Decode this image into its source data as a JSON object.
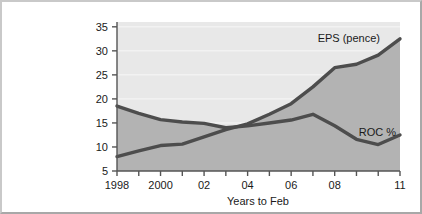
{
  "chart_data": {
    "type": "area",
    "title": "",
    "subtitle": "",
    "xlabel": "Years to Feb",
    "ylabel": "",
    "xlim": [
      1998,
      2011
    ],
    "ylim": [
      5,
      36
    ],
    "grid": true,
    "legend_position": "inline-right",
    "x": [
      1998,
      1999,
      2000,
      2001,
      2002,
      2003,
      2004,
      2005,
      2006,
      2007,
      2008,
      2009,
      2010,
      2011
    ],
    "x_tick_values": [
      1998,
      1999,
      2000,
      2001,
      2002,
      2003,
      2004,
      2005,
      2006,
      2007,
      2008,
      2009,
      2010,
      2011
    ],
    "x_tick_labels": [
      "1998",
      "",
      "2000",
      "",
      "02",
      "",
      "04",
      "",
      "06",
      "",
      "08",
      "",
      "",
      "11"
    ],
    "y_tick_values": [
      5,
      10,
      15,
      20,
      25,
      30,
      35
    ],
    "y_tick_labels": [
      "5",
      "10",
      "15",
      "20",
      "25",
      "30",
      "35"
    ],
    "series": [
      {
        "name": "EPS (pence)",
        "label": "EPS (pence)",
        "unit": "pence",
        "values": [
          8.0,
          9.2,
          10.3,
          10.6,
          12.1,
          13.6,
          14.8,
          16.8,
          19.0,
          22.5,
          26.5,
          27.2,
          29.1,
          32.5
        ]
      },
      {
        "name": "ROC %",
        "label": "ROC %",
        "unit": "%",
        "values": [
          18.5,
          17.0,
          15.7,
          15.2,
          14.9,
          14.0,
          14.4,
          15.0,
          15.6,
          16.8,
          14.4,
          11.6,
          10.5,
          12.5
        ]
      }
    ],
    "colors": {
      "line": "#4d4d4d",
      "plot_background": "#e8e8e8",
      "fill_between": "#b3b3b3",
      "gridline": "#f7f7f7",
      "axis": "#555555",
      "text": "#1a1a1a"
    }
  },
  "labels": {
    "eps_series_label": "EPS (pence)",
    "roc_series_label": "ROC %",
    "x_axis_title": "Years to Feb"
  }
}
